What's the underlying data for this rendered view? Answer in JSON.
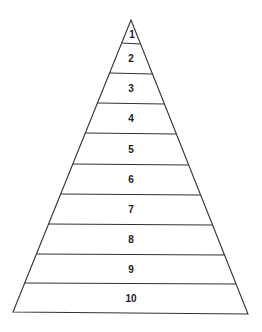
{
  "diagram": {
    "type": "pyramid",
    "orientation": "apex-top",
    "levels": [
      {
        "label": "1"
      },
      {
        "label": "2"
      },
      {
        "label": "3"
      },
      {
        "label": "4"
      },
      {
        "label": "5"
      },
      {
        "label": "6"
      },
      {
        "label": "7"
      },
      {
        "label": "8"
      },
      {
        "label": "9"
      },
      {
        "label": "10"
      }
    ],
    "colors": {
      "line": "#333333",
      "fill": "#ffffff",
      "text": "#222222"
    }
  }
}
